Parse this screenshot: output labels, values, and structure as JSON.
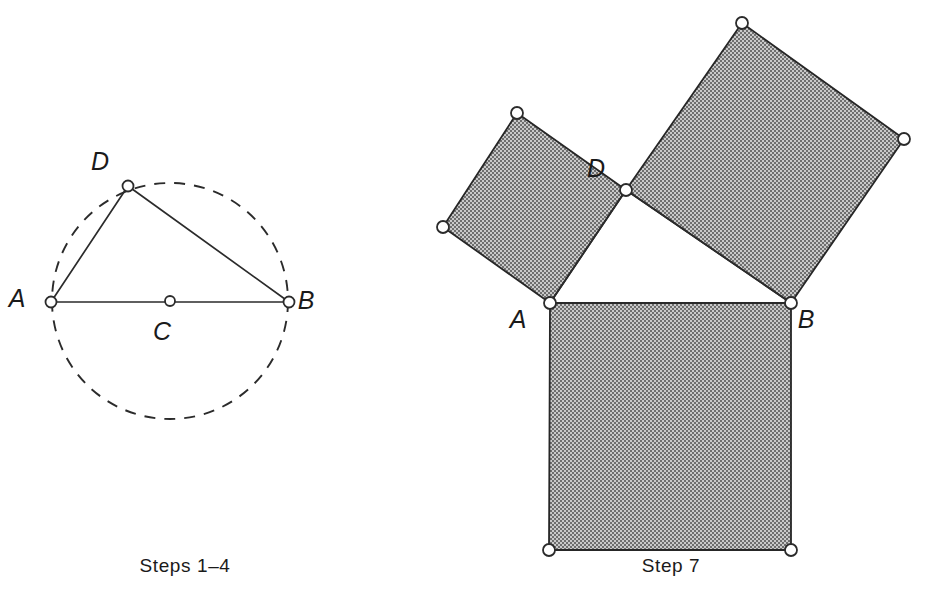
{
  "figure": {
    "background_color": "#ffffff",
    "ink_color": "#2b2b2b",
    "hatch_fill_color": "#9a9a9a"
  },
  "panels": [
    {
      "id": "left-panel",
      "caption": "Steps 1–4",
      "caption_position": {
        "x": 185,
        "y": 572
      },
      "description": "Dashed circle with center C, diameter AB, and point D on the circle forming right triangle ADB",
      "circle": {
        "center": {
          "x": 170,
          "y": 301
        },
        "radius": 118,
        "style": "dashed",
        "dash_on": 11,
        "dash_off": 9
      },
      "points": [
        {
          "name": "A",
          "x": 51,
          "y": 302,
          "label": "A",
          "label_x": 17,
          "label_y": 307,
          "marker": "open-circle",
          "radius": 5.5
        },
        {
          "name": "B",
          "x": 289,
          "y": 302,
          "label": "B",
          "label_x": 306,
          "label_y": 309,
          "marker": "open-circle",
          "radius": 5.5
        },
        {
          "name": "C",
          "x": 170,
          "y": 301,
          "label": "C",
          "label_x": 162,
          "label_y": 340,
          "marker": "open-circle",
          "radius": 5.0
        },
        {
          "name": "D",
          "x": 128,
          "y": 186,
          "label": "D",
          "label_x": 100,
          "label_y": 170,
          "marker": "open-circle",
          "radius": 5.5
        }
      ],
      "segments": [
        {
          "name": "segment-AB",
          "from": "A",
          "to": "B"
        },
        {
          "name": "segment-AD",
          "from": "A",
          "to": "D"
        },
        {
          "name": "segment-DB",
          "from": "D",
          "to": "B"
        }
      ]
    },
    {
      "id": "right-panel",
      "caption": "Step 7",
      "caption_position": {
        "x": 671,
        "y": 572
      },
      "description": "Right triangle ADB with hatched squares constructed outward on each of the three sides",
      "points": [
        {
          "name": "A",
          "x": 550,
          "y": 303,
          "label": "A",
          "label_x": 518,
          "label_y": 328,
          "marker": "open-circle",
          "radius": 6.0
        },
        {
          "name": "B",
          "x": 791,
          "y": 303,
          "label": "B",
          "label_x": 806,
          "label_y": 328,
          "marker": "open-circle",
          "radius": 6.0
        },
        {
          "name": "D",
          "x": 626,
          "y": 190,
          "label": "D",
          "label_x": 596,
          "label_y": 177,
          "marker": "open-circle",
          "radius": 6.0
        }
      ],
      "segments": [
        {
          "name": "segment-AB",
          "from": "A",
          "to": "B"
        },
        {
          "name": "segment-AD",
          "from": "A",
          "to": "D"
        },
        {
          "name": "segment-DB",
          "from": "D",
          "to": "B"
        }
      ],
      "squares": [
        {
          "name": "square-on-AB",
          "side_label": "AB",
          "fill": "hatch",
          "vertices": [
            {
              "x": 550,
              "y": 303
            },
            {
              "x": 791,
              "y": 303
            },
            {
              "x": 791,
              "y": 550
            },
            {
              "x": 549,
              "y": 550
            }
          ],
          "corner_markers": [
            {
              "x": 791,
              "y": 550,
              "radius": 6.0
            },
            {
              "x": 549,
              "y": 550,
              "radius": 6.0
            }
          ]
        },
        {
          "name": "square-on-AD",
          "side_label": "AD",
          "fill": "hatch",
          "vertices": [
            {
              "x": 550,
              "y": 303
            },
            {
              "x": 626,
              "y": 190
            },
            {
              "x": 517,
              "y": 113
            },
            {
              "x": 443,
              "y": 227
            }
          ],
          "corner_markers": [
            {
              "x": 517,
              "y": 113,
              "radius": 6.0
            },
            {
              "x": 443,
              "y": 227,
              "radius": 6.0
            }
          ]
        },
        {
          "name": "square-on-DB",
          "side_label": "DB",
          "fill": "hatch",
          "vertices": [
            {
              "x": 626,
              "y": 190
            },
            {
              "x": 791,
              "y": 303
            },
            {
              "x": 904,
              "y": 139
            },
            {
              "x": 742,
              "y": 23
            }
          ],
          "corner_markers": [
            {
              "x": 904,
              "y": 139,
              "radius": 6.0
            },
            {
              "x": 742,
              "y": 23,
              "radius": 6.0
            }
          ]
        }
      ]
    }
  ]
}
